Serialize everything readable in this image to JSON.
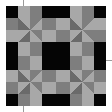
{
  "image": {
    "description": "Grayscale quilt block pattern with pinwheel motifs and black corner squares",
    "colors": {
      "background": "#ffffff",
      "black": "#050505",
      "light": "#a8a8a8",
      "mid": "#7e7e7e",
      "dark": "#6a6a6a"
    },
    "grid": {
      "origin": 6,
      "size": 100,
      "cells": 8
    }
  }
}
